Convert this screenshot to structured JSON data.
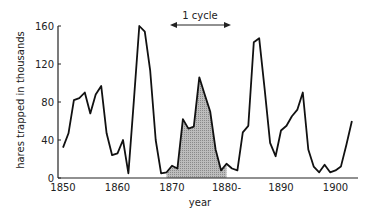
{
  "chart_data": {
    "type": "line",
    "title": "",
    "xlabel": "year",
    "ylabel": "hares trapped in thousands",
    "xlim": [
      1850,
      1903
    ],
    "ylim": [
      0,
      160
    ],
    "grid": false,
    "legend": null,
    "x_ticks": [
      1850,
      1860,
      1870,
      1880,
      1890,
      1900
    ],
    "x_tick_labels": [
      "1850",
      "1860",
      "1870",
      "1880-",
      "1890",
      "1900"
    ],
    "y_ticks": [
      0,
      40,
      80,
      120,
      160
    ],
    "y_tick_labels": [
      "0",
      "40",
      "80",
      "120",
      "160"
    ],
    "annotations": [
      {
        "text": "1 cycle",
        "type": "double-arrow",
        "from_year": 1869.5,
        "to_year": 1880.5
      },
      {
        "type": "shaded-area",
        "from_year": 1869,
        "to_year": 1880,
        "description": "one cycle shaded"
      }
    ],
    "series": [
      {
        "name": "hares",
        "x": [
          1850,
          1851,
          1852,
          1853,
          1854,
          1855,
          1856,
          1857,
          1858,
          1859,
          1860,
          1861,
          1862,
          1863,
          1864,
          1865,
          1866,
          1867,
          1868,
          1869,
          1870,
          1871,
          1872,
          1873,
          1874,
          1875,
          1876,
          1877,
          1878,
          1879,
          1880,
          1881,
          1882,
          1883,
          1884,
          1885,
          1886,
          1887,
          1888,
          1889,
          1890,
          1891,
          1892,
          1893,
          1894,
          1895,
          1896,
          1897,
          1898,
          1899,
          1900,
          1901,
          1902,
          1903
        ],
        "values": [
          32,
          47,
          82,
          84,
          90,
          68,
          88,
          97,
          47,
          24,
          26,
          40,
          5,
          82,
          160,
          154,
          113,
          40,
          5,
          6,
          13,
          10,
          62,
          52,
          54,
          106,
          88,
          70,
          30,
          8,
          15,
          10,
          8,
          48,
          55,
          143,
          147,
          94,
          37,
          23,
          50,
          55,
          65,
          72,
          90,
          30,
          12,
          6,
          14,
          6,
          8,
          12,
          35,
          60
        ]
      }
    ]
  }
}
